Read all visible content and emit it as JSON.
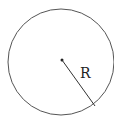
{
  "diagram": {
    "title": "",
    "shape": "circle",
    "radius_label": "R",
    "stroke_color": "#555555",
    "center_point": {
      "x": 62,
      "y": 60
    },
    "radius_end_point": {
      "x": 95,
      "y": 106
    }
  }
}
